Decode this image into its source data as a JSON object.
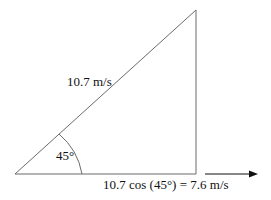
{
  "diagram": {
    "type": "vector-triangle",
    "hypotenuse_label": "10.7 m/s",
    "angle_label": "45°",
    "horizontal_label": "10.7 cos (45°) = 7.6 m/s",
    "arrow_direction": "right",
    "line_color": "#6b6b6b",
    "arrow_color": "#111111"
  }
}
